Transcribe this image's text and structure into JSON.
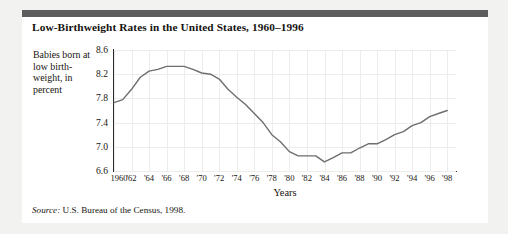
{
  "card": {
    "title": "Low-Birthweight Rates in the United States, 1960–1996",
    "source_label": "Source:",
    "source_text": "U.S. Bureau of the Census, 1998.",
    "accent_bar_color": "#5d5d5d",
    "background": "#ffffff"
  },
  "chart_data": {
    "type": "line",
    "title": "Low-Birthweight Rates in the United States, 1960–1996",
    "xlabel": "Years",
    "ylabel": "Babies born at low birth-weight, in percent",
    "ylim": [
      6.6,
      8.6
    ],
    "xlim": [
      1960,
      1999
    ],
    "yticks": [
      "8.6",
      "8.2",
      "7.8",
      "7.4",
      "7.0",
      "6.6"
    ],
    "ytick_values": [
      8.6,
      8.2,
      7.8,
      7.4,
      7.0,
      6.6
    ],
    "xticks": [
      "1960",
      "'62",
      "'64",
      "'66",
      "'68",
      "'70",
      "'72",
      "'74",
      "'76",
      "'78",
      "'80",
      "'82",
      "'84",
      "'86",
      "'88",
      "'90",
      "'92",
      "'94",
      "'96",
      "'98"
    ],
    "xtick_values": [
      1960,
      1962,
      1964,
      1966,
      1968,
      1970,
      1972,
      1974,
      1976,
      1978,
      1980,
      1982,
      1984,
      1986,
      1988,
      1990,
      1992,
      1994,
      1996,
      1998
    ],
    "grid": "faint",
    "legend": "none",
    "line_color": "#6e6e6e",
    "x": [
      1960,
      1961,
      1962,
      1963,
      1964,
      1965,
      1966,
      1967,
      1968,
      1969,
      1970,
      1971,
      1972,
      1973,
      1974,
      1975,
      1976,
      1977,
      1978,
      1979,
      1980,
      1981,
      1982,
      1983,
      1984,
      1985,
      1986,
      1987,
      1988,
      1989,
      1990,
      1991,
      1992,
      1993,
      1994,
      1995,
      1996,
      1997,
      1998
    ],
    "values": [
      7.73,
      7.78,
      7.95,
      8.15,
      8.25,
      8.28,
      8.33,
      8.33,
      8.33,
      8.28,
      8.22,
      8.2,
      8.12,
      7.95,
      7.82,
      7.7,
      7.55,
      7.4,
      7.2,
      7.08,
      6.92,
      6.85,
      6.85,
      6.85,
      6.75,
      6.82,
      6.9,
      6.9,
      6.98,
      7.05,
      7.05,
      7.12,
      7.2,
      7.25,
      7.35,
      7.4,
      7.5,
      7.55,
      7.6
    ]
  }
}
